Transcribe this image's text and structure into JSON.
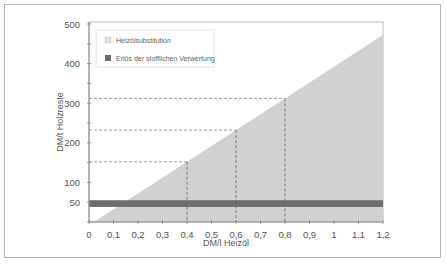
{
  "chart_data": {
    "type": "area",
    "title": "",
    "xlabel": "DM/l Heizöl",
    "ylabel": "DM/t Holzreste",
    "xlim": [
      0,
      1.2
    ],
    "ylim": [
      0,
      500
    ],
    "x_ticks": [
      "0",
      "0,1",
      "0,2",
      "0,3",
      "0,4",
      "0,5",
      "0,6",
      "0,7",
      "0,8",
      "0,9",
      "1",
      "1,1",
      "1,2"
    ],
    "y_ticks": [
      "50",
      "100",
      "200",
      "300",
      "400",
      "500"
    ],
    "grid": false,
    "legend_position": "upper left",
    "series": [
      {
        "name": "Heizölsubstitution",
        "kind": "area-triangle",
        "color": "#d6d6d6",
        "x": [
          0.02,
          0.4,
          0.6,
          0.8,
          1.2
        ],
        "y": [
          0,
          152,
          232,
          312,
          472
        ]
      },
      {
        "name": "Erlös der stofflichen Verwertung",
        "kind": "horizontal-band",
        "color": "#6e6e6e",
        "y_range": [
          38,
          55
        ]
      }
    ],
    "annotations": [
      {
        "type": "dashed-guide",
        "x": 0.4,
        "y": 152
      },
      {
        "type": "dashed-guide",
        "x": 0.6,
        "y": 232
      },
      {
        "type": "dashed-guide",
        "x": 0.8,
        "y": 312
      }
    ]
  },
  "legend": {
    "items": [
      {
        "label": "Heizölsubstitution",
        "color": "#dcdcdc"
      },
      {
        "label": "Erlös der stofflichen Verwertung",
        "color": "#6e6e6e"
      }
    ]
  },
  "axes": {
    "xlabel": "DM/l Heizöl",
    "ylabel": "DM/t Holzreste"
  }
}
